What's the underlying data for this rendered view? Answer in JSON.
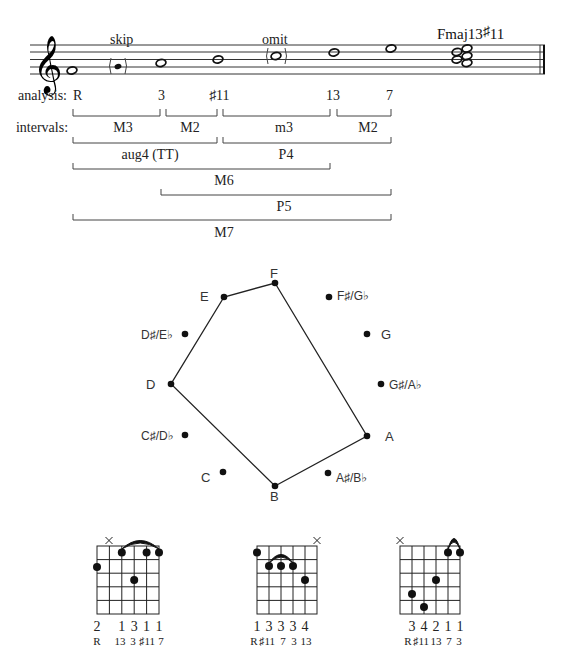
{
  "staff": {
    "annotations": {
      "skip": "skip",
      "omit": "omit"
    },
    "chord_symbol": {
      "base": "Fmaj13",
      "sharp": "♯",
      "ext": "11"
    },
    "notes": [
      "F",
      "G (skip)",
      "A",
      "B",
      "C (omit)",
      "D",
      "E",
      "chord F-A-B-D-E"
    ]
  },
  "analysis": {
    "label": "analysis:",
    "degrees": [
      "R",
      "3",
      "♯11",
      "13",
      "7"
    ]
  },
  "intervals": {
    "label": "intervals:",
    "rows": [
      [
        {
          "label": "M3"
        },
        {
          "label": "M2"
        },
        {
          "label": "m3"
        },
        {
          "label": "M2"
        }
      ],
      [
        {
          "label": "aug4 (TT)"
        },
        {
          "label": "P4"
        }
      ],
      [
        {
          "label": "M6"
        }
      ],
      [
        {
          "label": "P5"
        }
      ],
      [
        {
          "label": "M7"
        }
      ]
    ]
  },
  "pitch_circle": {
    "labels": {
      "F": "F",
      "Fs": "F♯/G♭",
      "G": "G",
      "Gs": "G♯/A♭",
      "A": "A",
      "As": "A♯/B♭",
      "B": "B",
      "C": "C",
      "Cs": "C♯/D♭",
      "D": "D",
      "Ds": "D♯/E♭",
      "E": "E"
    },
    "polygon_notes": [
      "F",
      "A",
      "B",
      "D",
      "E"
    ]
  },
  "chord_diagrams": [
    {
      "fingers": [
        "2",
        "",
        "1",
        "3",
        "1",
        "1"
      ],
      "degrees": [
        "R",
        "",
        "13",
        "3",
        "♯11",
        "7"
      ],
      "muted": "string 2"
    },
    {
      "fingers": [
        "1",
        "3",
        "3",
        "3",
        "4",
        ""
      ],
      "degrees": [
        "R",
        "♯11",
        "7",
        "3",
        "13",
        ""
      ],
      "muted": "string 6"
    },
    {
      "fingers": [
        "",
        "3",
        "4",
        "2",
        "1",
        "1"
      ],
      "degrees": [
        "",
        "R",
        "♯11",
        "13",
        "7",
        "3"
      ],
      "muted": "string 1"
    }
  ]
}
